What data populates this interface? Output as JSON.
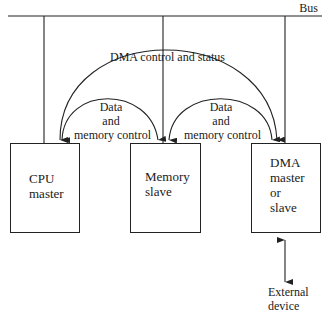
{
  "diagram": {
    "bus_label": "Bus",
    "arcs": {
      "dma_control": "DMA control and status",
      "left_data": [
        "Data",
        "and",
        "memory control"
      ],
      "right_data": [
        "Data",
        "and",
        "memory control"
      ]
    },
    "nodes": [
      {
        "id": "cpu",
        "lines": [
          "CPU",
          "master"
        ]
      },
      {
        "id": "memory",
        "lines": [
          "Memory",
          "slave"
        ]
      },
      {
        "id": "dma",
        "lines": [
          "DMA",
          "master",
          "or",
          "slave"
        ]
      }
    ],
    "external": [
      "External",
      "device"
    ],
    "line_color": "#222222"
  }
}
